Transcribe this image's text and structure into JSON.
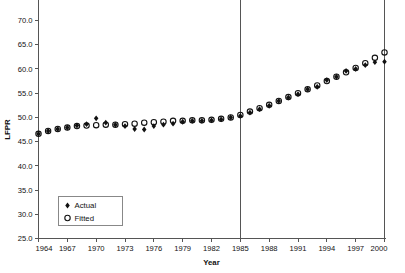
{
  "chart_data": {
    "type": "scatter",
    "title": "",
    "xlabel": "Year",
    "ylabel": "LFPR",
    "xlim": [
      1964,
      2000
    ],
    "ylim": [
      25.0,
      70.0
    ],
    "grid": false,
    "legend_position": "lower-left",
    "x_ticks": [
      "1964",
      "1967",
      "1970",
      "1973",
      "1976",
      "1979",
      "1982",
      "1985",
      "1988",
      "1991",
      "1994",
      "1997",
      "2000"
    ],
    "y_ticks": [
      "25.0",
      "30.0",
      "35.0",
      "40.0",
      "45.0",
      "50.0",
      "55.0",
      "60.0",
      "65.0",
      "70.0"
    ],
    "x": [
      1964,
      1965,
      1966,
      1967,
      1968,
      1969,
      1970,
      1971,
      1972,
      1973,
      1974,
      1975,
      1976,
      1977,
      1978,
      1979,
      1980,
      1981,
      1982,
      1983,
      1984,
      1985,
      1986,
      1987,
      1988,
      1989,
      1990,
      1991,
      1992,
      1993,
      1994,
      1995,
      1996,
      1997,
      1998,
      1999,
      2000
    ],
    "series": [
      {
        "name": "Actual",
        "marker": "filled-diamond",
        "color": "#111111",
        "values": [
          46.6,
          47.2,
          47.6,
          47.9,
          48.3,
          48.6,
          49.8,
          48.9,
          48.5,
          48.2,
          47.6,
          47.5,
          48.2,
          48.5,
          48.7,
          49.1,
          49.3,
          49.3,
          49.4,
          49.6,
          50.0,
          50.3,
          51.0,
          51.7,
          52.4,
          53.4,
          54.1,
          54.8,
          55.8,
          56.3,
          57.7,
          58.4,
          59.6,
          60.0,
          60.8,
          61.4,
          61.5
        ]
      },
      {
        "name": "Fitted",
        "marker": "open-circle",
        "color": "#111111",
        "values": [
          46.6,
          47.2,
          47.6,
          47.9,
          48.2,
          48.3,
          48.4,
          48.5,
          48.5,
          48.6,
          48.7,
          48.9,
          49.0,
          49.1,
          49.3,
          49.3,
          49.4,
          49.4,
          49.5,
          49.7,
          50.0,
          50.5,
          51.2,
          51.9,
          52.6,
          53.4,
          54.2,
          55.0,
          55.8,
          56.6,
          57.5,
          58.4,
          59.3,
          60.2,
          61.2,
          62.3,
          63.4
        ]
      }
    ],
    "reference_lines": [
      {
        "axis": "x",
        "value": 1985
      },
      {
        "axis": "x",
        "value": 2000
      }
    ],
    "legend_entries": [
      {
        "label": "Actual",
        "marker": "filled-diamond"
      },
      {
        "label": "Fitted",
        "marker": "open-circle"
      }
    ]
  }
}
